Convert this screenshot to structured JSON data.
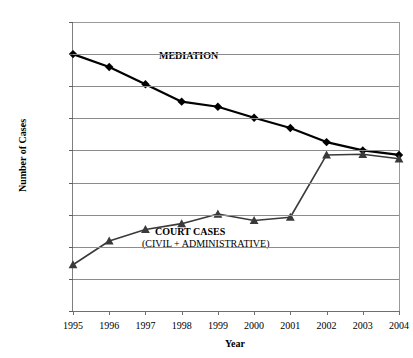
{
  "chart_data": {
    "type": "line",
    "title": "",
    "xlabel": "Year",
    "ylabel": "Number of Cases",
    "categories": [
      "1995",
      "1996",
      "1997",
      "1998",
      "1999",
      "2000",
      "2001",
      "2002",
      "2003",
      "2004"
    ],
    "x": [
      1995,
      1996,
      1997,
      1998,
      1999,
      2000,
      2001,
      2002,
      2003,
      2004
    ],
    "ylim": [
      2000000,
      6500000
    ],
    "xlim": [
      1995,
      2004
    ],
    "grid": true,
    "legend_position": "inline-annotation",
    "ytick_labels": [
      "2.00E+06",
      "2.50E+06",
      "3.00E+06",
      "3.50E+06",
      "4.00E+06",
      "4.50E+06",
      "5.00E+06",
      "5.50E+06",
      "6.00E+06",
      "6.50E+06"
    ],
    "ytick_values": [
      2000000,
      2500000,
      3000000,
      3500000,
      4000000,
      4500000,
      5000000,
      5500000,
      6000000,
      6500000
    ],
    "series": [
      {
        "name": "MEDIATION",
        "marker": "diamond",
        "color": "#000000",
        "values": [
          6000000,
          5800000,
          5530000,
          5260000,
          5180000,
          5010000,
          4850000,
          4630000,
          4500000,
          4430000
        ]
      },
      {
        "name": "COURT CASES (CIVIL + ADMINISTRATIVE)",
        "marker": "triangle",
        "color": "#3a3a3a",
        "values": [
          2720000,
          3090000,
          3270000,
          3360000,
          3510000,
          3410000,
          3460000,
          4430000,
          4440000,
          4370000
        ]
      }
    ],
    "annotations": [
      {
        "text": "MEDIATION",
        "bold": true
      },
      {
        "text": "COURT CASES",
        "bold": true
      },
      {
        "text": "(CIVIL + ADMINISTRATIVE)",
        "bold": false
      }
    ]
  },
  "axes": {
    "y_title": "Number of Cases",
    "x_title": "Year"
  }
}
